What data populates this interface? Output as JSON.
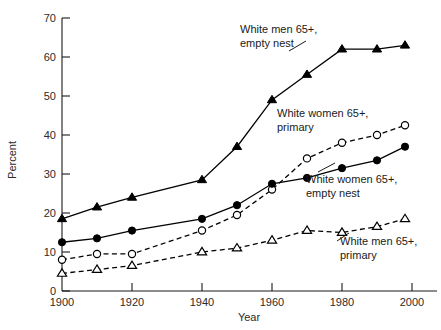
{
  "chart_data": {
    "type": "line",
    "title": "",
    "xlabel": "Year",
    "ylabel": "Percent",
    "xlim": [
      1900,
      2010
    ],
    "ylim": [
      0,
      70
    ],
    "xticks": [
      1900,
      1920,
      1940,
      1960,
      1980,
      2000
    ],
    "yticks": [
      0,
      10,
      20,
      30,
      40,
      50,
      60,
      70
    ],
    "grid": false,
    "legend": "inline-annotations",
    "x": [
      1900,
      1910,
      1920,
      1940,
      1950,
      1960,
      1970,
      1980,
      1990,
      1998
    ],
    "series": [
      {
        "name": "White men 65+, empty nest",
        "marker": "filled-triangle",
        "linestyle": "solid",
        "color": "#000000",
        "values": [
          18.5,
          21.5,
          24.0,
          28.5,
          37.0,
          49.0,
          55.5,
          62.0,
          62.0,
          63.0
        ]
      },
      {
        "name": "White women 65+, primary",
        "marker": "open-circle",
        "linestyle": "dashed",
        "color": "#000000",
        "values": [
          8.0,
          9.5,
          9.5,
          15.5,
          19.5,
          26.0,
          34.0,
          38.0,
          40.0,
          42.5
        ]
      },
      {
        "name": "White women 65+, empty nest",
        "marker": "filled-circle",
        "linestyle": "solid",
        "color": "#000000",
        "values": [
          12.5,
          13.5,
          15.5,
          18.5,
          22.0,
          27.5,
          29.0,
          31.5,
          33.5,
          37.0
        ]
      },
      {
        "name": "White men 65+, primary",
        "marker": "open-triangle",
        "linestyle": "dashed",
        "color": "#000000",
        "values": [
          4.5,
          5.5,
          6.5,
          10.0,
          11.0,
          13.0,
          15.5,
          15.0,
          16.5,
          18.5
        ]
      }
    ],
    "annotations": [
      {
        "id": "ann-men-empty",
        "line1": "White men 65+,",
        "line2": "empty nest"
      },
      {
        "id": "ann-women-primary",
        "line1": "White women 65+,",
        "line2": "primary"
      },
      {
        "id": "ann-women-empty",
        "line1": "White women 65+,",
        "line2": "empty nest"
      },
      {
        "id": "ann-men-primary",
        "line1": "White men 65+,",
        "line2": "primary"
      }
    ]
  },
  "axes": {
    "y_title": "Percent",
    "x_title": "Year",
    "y_tick_labels": [
      "0",
      "10",
      "20",
      "30",
      "40",
      "50",
      "60",
      "70"
    ],
    "x_tick_labels": [
      "1900",
      "1920",
      "1940",
      "1960",
      "1980",
      "2000"
    ]
  }
}
